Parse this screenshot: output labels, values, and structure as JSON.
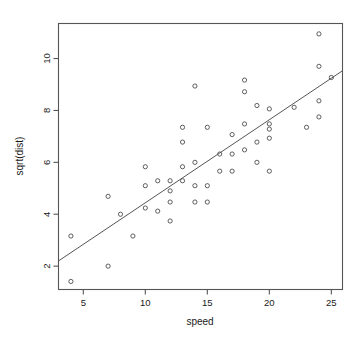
{
  "chart_data": {
    "type": "scatter",
    "title": "",
    "xlabel": "speed",
    "ylabel": "sqrt(dist)",
    "xlim": [
      3.0,
      25.9
    ],
    "ylim": [
      1.1,
      11.35
    ],
    "xticks": [
      5,
      10,
      15,
      20,
      25
    ],
    "yticks": [
      2,
      4,
      6,
      8,
      10
    ],
    "xtick_labels": [
      "5",
      "10",
      "15",
      "20",
      "25"
    ],
    "ytick_labels": [
      "2",
      "4",
      "6",
      "8",
      "10"
    ],
    "grid": false,
    "legend": null,
    "marker": "open-circle",
    "x": [
      4,
      4,
      7,
      7,
      8,
      9,
      10,
      10,
      10,
      11,
      11,
      12,
      12,
      12,
      12,
      13,
      13,
      13,
      13,
      14,
      14,
      14,
      14,
      15,
      15,
      15,
      16,
      16,
      17,
      17,
      17,
      18,
      18,
      18,
      18,
      19,
      19,
      19,
      20,
      20,
      20,
      20,
      20,
      22,
      23,
      24,
      24,
      24,
      24,
      25
    ],
    "y": [
      3.16,
      1.41,
      2.0,
      4.69,
      4.0,
      3.16,
      4.24,
      5.1,
      5.83,
      4.12,
      5.29,
      3.74,
      4.47,
      4.9,
      5.29,
      5.29,
      5.83,
      6.78,
      7.35,
      4.47,
      5.1,
      6.0,
      8.94,
      4.47,
      5.1,
      7.35,
      6.32,
      5.66,
      5.66,
      6.32,
      7.07,
      6.48,
      7.48,
      8.72,
      9.17,
      6.0,
      6.78,
      8.19,
      6.93,
      7.28,
      7.48,
      8.06,
      5.66,
      8.12,
      7.35,
      7.75,
      8.37,
      9.7,
      10.95,
      9.27
    ],
    "series_name": "cars",
    "fit_line": {
      "name": "linear regression",
      "x_start": 3.0,
      "y_start": 2.2,
      "x_end": 25.9,
      "y_end": 9.53
    }
  },
  "axes": {
    "xlabel": "speed",
    "ylabel": "sqrt(dist)"
  },
  "colors": {
    "background": "#ffffff",
    "frame": "#555555",
    "point": "#4d4d4d",
    "line": "#555555",
    "text": "#1a1a1a"
  }
}
